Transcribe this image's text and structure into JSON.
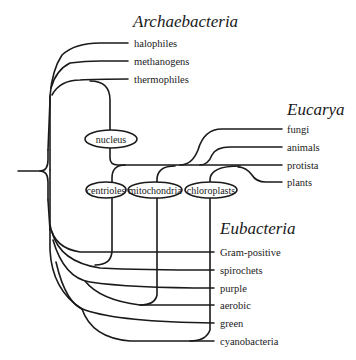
{
  "diagram": {
    "type": "phylogenetic-tree",
    "groups": {
      "archaebacteria": {
        "title": "Archaebacteria",
        "leaves": [
          "halophiles",
          "methanogens",
          "thermophiles"
        ]
      },
      "eucarya": {
        "title": "Eucarya",
        "leaves": [
          "fungi",
          "animals",
          "protista",
          "plants"
        ]
      },
      "eubacteria": {
        "title": "Eubacteria",
        "leaves": [
          "Gram-positive",
          "spirochets",
          "purple",
          "aerobic",
          "green",
          "cyanobacteria"
        ]
      }
    },
    "nodes": {
      "nucleus": "nucleus",
      "centrioles": "centrioles",
      "mitochondria": "mitochondria",
      "chloroplasts": "chloroplasts"
    },
    "colors": {
      "line": "#1a1a1a",
      "background": "#ffffff"
    }
  }
}
